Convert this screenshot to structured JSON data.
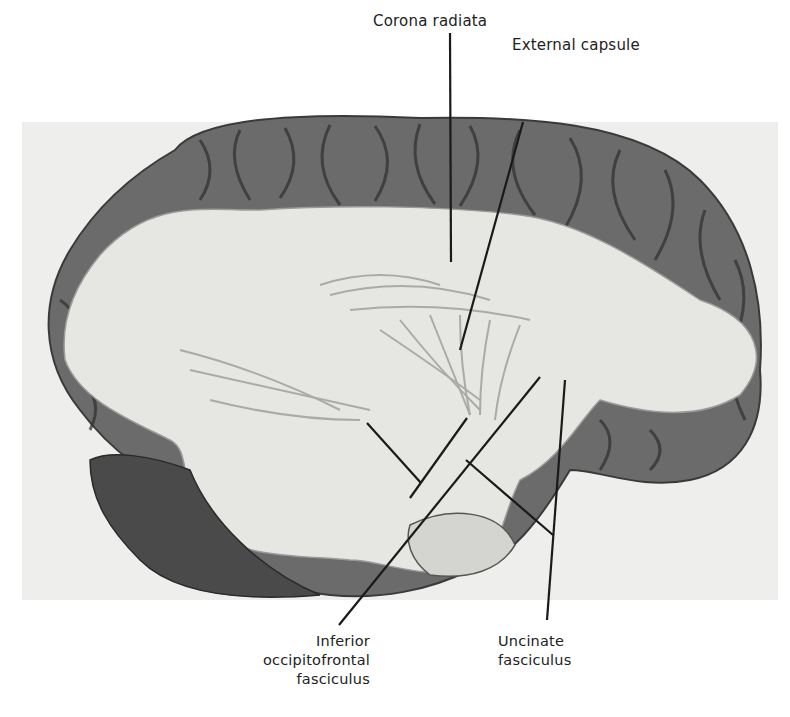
{
  "figure": {
    "labels": {
      "corona_radiata": "Corona radiata",
      "external_capsule": "External capsule",
      "inferior_occipitofrontal_line1": "Inferior",
      "inferior_occipitofrontal_line2": "occipitofrontal",
      "inferior_occipitofrontal_line3": "fasciculus",
      "uncinate_line1": "Uncinate",
      "uncinate_line2": "fasciculus"
    },
    "colors": {
      "background": "#ffffff",
      "photo_background": "#eeeeec",
      "cortex_dark": "#5a5a5a",
      "white_matter": "#e6e6e2",
      "leader_line": "#1a1a1a"
    }
  }
}
